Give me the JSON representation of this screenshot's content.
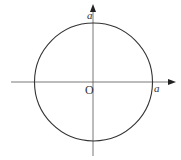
{
  "diagram": {
    "type": "circle-on-axes",
    "center_label": "O",
    "top_intercept_label": "a",
    "right_intercept_label": "a",
    "colors": {
      "stroke": "#333333",
      "axis": "#444444",
      "background": "#ffffff"
    },
    "geometry": {
      "center": [
        93,
        82
      ],
      "radius": 59,
      "x_axis": {
        "y": 82,
        "x_start": 11,
        "x_end": 176
      },
      "y_axis": {
        "x": 93,
        "y_start": 156,
        "y_end": 4
      }
    }
  }
}
